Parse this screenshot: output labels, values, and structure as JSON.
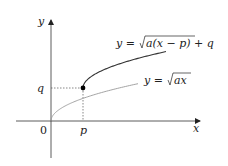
{
  "diagram": {
    "axes": {
      "x_label": "x",
      "y_label": "y",
      "origin_label": "0"
    },
    "marks": {
      "p_label": "p",
      "q_label": "q"
    },
    "curves": {
      "base": {
        "label_lhs": "y = ",
        "label_radicand": "ax",
        "color": "#999999"
      },
      "shifted": {
        "label_lhs": "y = ",
        "label_radicand": "a(x − p)",
        "label_tail": " + q",
        "color": "#333333"
      }
    },
    "point_color": "#000000"
  }
}
